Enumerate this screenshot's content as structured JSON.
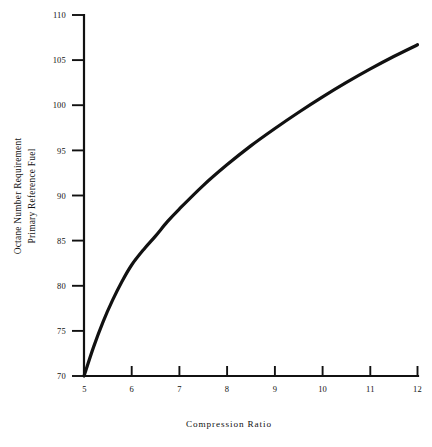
{
  "figure": {
    "background": "#ffffff",
    "ink_color": "#111111"
  },
  "chart_data": {
    "type": "line",
    "title": "",
    "xlabel": "Compression Ratio",
    "ylabel": "Octane Number Requirement Primary Reference Fuel",
    "ylabel_lines": [
      "Octane Number Requirement",
      "Primary Reference Fuel"
    ],
    "xlim": [
      5,
      12
    ],
    "ylim": [
      70,
      110
    ],
    "xticks": [
      5,
      6,
      7,
      8,
      9,
      10,
      11,
      12
    ],
    "xticklabels": [
      "5",
      "6",
      "7",
      "8",
      "9",
      "10",
      "11",
      "12"
    ],
    "yticks": [
      70,
      75,
      80,
      85,
      90,
      95,
      100,
      105,
      110
    ],
    "yticklabels": [
      "70",
      "75",
      "80",
      "85",
      "90",
      "95",
      "100",
      "105",
      "110"
    ],
    "grid": false,
    "legend": null,
    "series": [
      {
        "name": "Octane Number Requirement",
        "x": [
          5.0,
          5.2,
          5.4,
          5.6,
          5.8,
          6.0,
          6.25,
          6.5,
          6.75,
          7.0,
          7.5,
          8.0,
          8.5,
          9.0,
          9.5,
          10.0,
          10.5,
          11.0,
          11.5,
          12.0
        ],
        "values": [
          70.0,
          73.2,
          76.0,
          78.4,
          80.5,
          82.3,
          84.0,
          85.5,
          87.1,
          88.5,
          91.1,
          93.4,
          95.5,
          97.4,
          99.2,
          100.9,
          102.5,
          104.0,
          105.4,
          106.7
        ]
      }
    ]
  },
  "axes": {
    "y_title_line1": "Octane Number Requirement",
    "y_title_line2": "Primary Reference Fuel",
    "x_title": "Compression Ratio"
  }
}
